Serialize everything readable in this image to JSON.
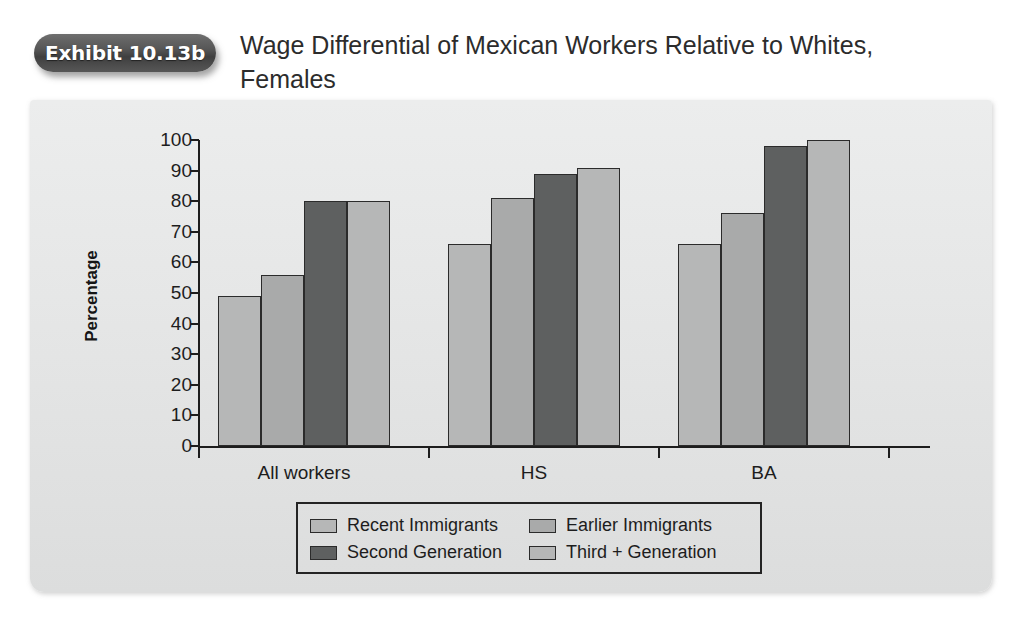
{
  "header": {
    "badge_label": "Exhibit 10.13b",
    "title": "Wage Differential of Mexican Workers Relative to Whites, Females"
  },
  "chart_data": {
    "type": "bar",
    "title": "Wage Differential of Mexican Workers Relative to Whites, Females",
    "xlabel": "",
    "ylabel": "Percentage",
    "categories": [
      "All workers",
      "HS",
      "BA"
    ],
    "series": [
      {
        "name": "Recent Immigrants",
        "color": "#b6b7b7",
        "values": [
          49,
          66,
          66
        ]
      },
      {
        "name": "Earlier Immigrants",
        "color": "#a9aaaa",
        "values": [
          56,
          81,
          76
        ]
      },
      {
        "name": "Second Generation",
        "color": "#5e6060",
        "values": [
          80,
          89,
          98
        ]
      },
      {
        "name": "Third + Generation",
        "color": "#b6b7b7",
        "values": [
          80,
          91,
          100
        ]
      }
    ],
    "ylim": [
      0,
      100
    ],
    "yticks": [
      0,
      10,
      20,
      30,
      40,
      50,
      60,
      70,
      80,
      90,
      100
    ],
    "ytick_labels": [
      "0",
      "10",
      "20",
      "30",
      "40",
      "50",
      "60",
      "70",
      "80",
      "90",
      "100"
    ],
    "grid": false,
    "legend_position": "bottom",
    "legend_order": [
      "Recent Immigrants",
      "Earlier Immigrants",
      "Second Generation",
      "Third + Generation"
    ]
  },
  "colors": {
    "panel_background": "#e6e7e7",
    "axis": "#1d1d1d",
    "badge": "#505050",
    "bar_light": "#b6b7b7",
    "bar_medium": "#a9aaaa",
    "bar_dark": "#5e6060"
  }
}
